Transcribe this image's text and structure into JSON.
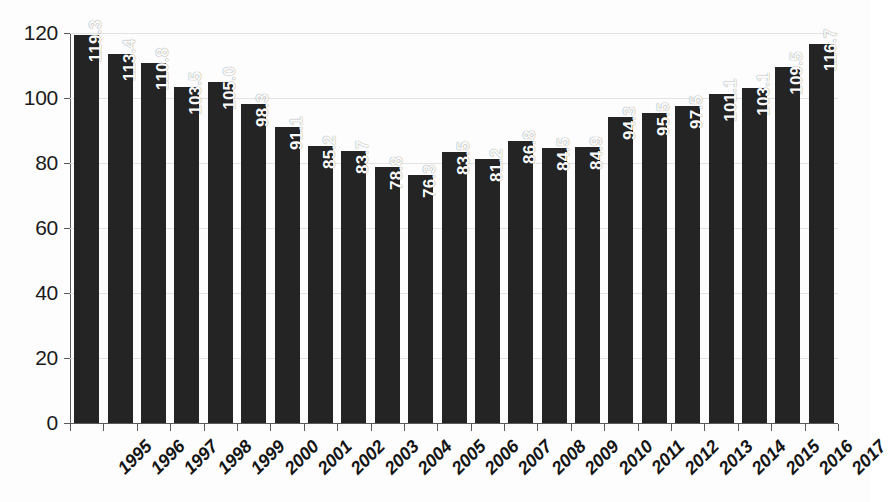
{
  "chart_data": {
    "type": "bar",
    "title": "",
    "subtitle": "",
    "xlabel": "",
    "ylabel": "",
    "categories": [
      "1995",
      "1996",
      "1997",
      "1998",
      "1999",
      "2000",
      "2001",
      "2002",
      "2003",
      "2004",
      "2005",
      "2006",
      "2007",
      "2008",
      "2009",
      "2010",
      "2011",
      "2012",
      "2013",
      "2014",
      "2015",
      "2016",
      "2017"
    ],
    "values": [
      119.3,
      113.4,
      110.8,
      103.5,
      105.0,
      98.3,
      91.1,
      85.2,
      83.7,
      78.8,
      76.3,
      83.5,
      81.2,
      86.8,
      84.5,
      84.9,
      94.3,
      95.5,
      97.5,
      101.1,
      103.1,
      109.5,
      116.7
    ],
    "value_labels": [
      "119.3",
      "113.4",
      "110.8",
      "103.5",
      "105.0",
      "98.3",
      "91.1",
      "85.2",
      "83.7",
      "78.8",
      "76.3",
      "83.5",
      "81.2",
      "86.8",
      "84.5",
      "84.9",
      "94.3",
      "95.5",
      "97.5",
      "101.1",
      "103.1",
      "109.5",
      "116.7"
    ],
    "ylim": [
      0,
      120
    ],
    "yticks": [
      0,
      20,
      40,
      60,
      80,
      100,
      120
    ],
    "ytick_labels": [
      "0",
      "20",
      "40",
      "60",
      "80",
      "100",
      "120"
    ],
    "grid": "horizontal",
    "legend": "none",
    "bar_color": "#242424",
    "value_label_color": "#fafafa",
    "gridline_color": "#e3e3e3",
    "axis_color": "#5a5a5a",
    "background_color": "#fdfdfd",
    "value_label_orientation": "vertical",
    "category_label_rotation": -45,
    "annotations": []
  }
}
